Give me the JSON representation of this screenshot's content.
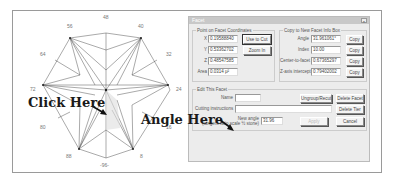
{
  "diagram": {
    "degree_labels": [
      {
        "text": "48",
        "x": 103,
        "y": 16
      },
      {
        "text": "56",
        "x": 67,
        "y": 24
      },
      {
        "text": "40",
        "x": 139,
        "y": 24
      },
      {
        "text": "64",
        "x": 40,
        "y": 52
      },
      {
        "text": "32",
        "x": 167,
        "y": 52
      },
      {
        "text": "72",
        "x": 31,
        "y": 87
      },
      {
        "text": "24",
        "x": 176,
        "y": 87
      },
      {
        "text": "80",
        "x": 40,
        "y": 124
      },
      {
        "text": "16",
        "x": 167,
        "y": 124
      },
      {
        "text": "88",
        "x": 66,
        "y": 153
      },
      {
        "text": "8",
        "x": 141,
        "y": 153
      },
      {
        "text": "-96-",
        "x": 101,
        "y": 162
      }
    ],
    "click_callout": "Click Here",
    "angle_callout": "Angle Here"
  },
  "dialog": {
    "title": "Facet",
    "close_label": "×",
    "point_group": {
      "label": "Point on Facet Coordinates",
      "x_label": "X",
      "x_value": "0.19588840",
      "y_label": "Y",
      "y_value": "0.53362702",
      "z_label": "Z",
      "z_value": "0.48547585",
      "area_label": "Area",
      "area_value": "0.0314 µ²",
      "use_to_cut": "Use to Cut",
      "zoom_in": "Zoom In"
    },
    "copy_group": {
      "label": "Copy to New Facet Info Box",
      "rows": [
        {
          "label": "Angle",
          "value": "31.961061°",
          "button": "Copy"
        },
        {
          "label": "Index",
          "value": "10.00",
          "button": "Copy"
        },
        {
          "label": "Center-to-facet",
          "value": "0.67365297",
          "button": "Copy"
        },
        {
          "label": "Z-axis intercept",
          "value": "0.79402002",
          "button": "Copy"
        }
      ]
    },
    "edit_group": {
      "label": "Edit This Facet",
      "name_label": "Name",
      "name_value": "",
      "cutting_label": "Cutting instructions",
      "cutting_value": "",
      "new_angle_label": "New angle",
      "new_angle_sublabel": "(tangent ratio scale ½ stone)",
      "new_angle_value": "31.96",
      "ungroup_button": "Ungroup/Recut",
      "delete_facet_button": "Delete Facet",
      "delete_tier_button": "Delete Tier",
      "apply_button": "Apply",
      "cancel_button": "Cancel"
    }
  }
}
